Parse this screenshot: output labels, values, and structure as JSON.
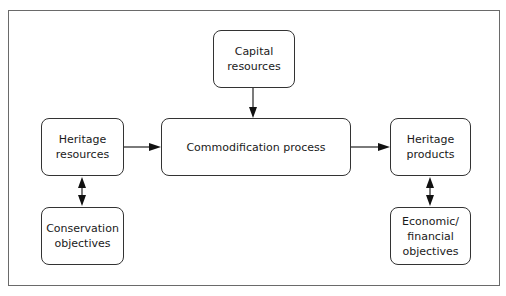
{
  "diagram": {
    "nodes": [
      {
        "id": "capital",
        "label": "Capital\nresources"
      },
      {
        "id": "heritage_resources",
        "label": "Heritage\nresources"
      },
      {
        "id": "commodification",
        "label": "Commodification process"
      },
      {
        "id": "heritage_products",
        "label": "Heritage\nproducts"
      },
      {
        "id": "conservation",
        "label": "Conservation\nobjectives"
      },
      {
        "id": "economic",
        "label": "Economic/\nfinancial\nobjectives"
      }
    ],
    "edges": [
      {
        "from": "capital",
        "to": "commodification",
        "type": "arrow"
      },
      {
        "from": "heritage_resources",
        "to": "commodification",
        "type": "arrow"
      },
      {
        "from": "commodification",
        "to": "heritage_products",
        "type": "arrow"
      },
      {
        "from": "heritage_resources",
        "to": "conservation",
        "type": "double-arrow"
      },
      {
        "from": "heritage_products",
        "to": "economic",
        "type": "double-arrow"
      }
    ]
  }
}
